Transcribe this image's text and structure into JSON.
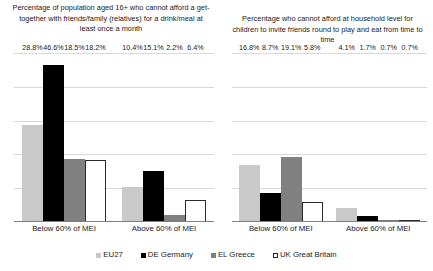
{
  "chart_data": [
    {
      "type": "bar",
      "id": "left",
      "title": "Percentage of population aged 16+ who cannot afford a get-together with friends/family (relatives) for a drink/meal at least once a month",
      "xlabel": "",
      "ylabel": "",
      "ylim": [
        0,
        50
      ],
      "grid": true,
      "gridlines": [
        10,
        20,
        30,
        40,
        50
      ],
      "legend_position": "bottom",
      "categories": [
        "Below 60% of MEI",
        "Above 60% of MEI"
      ],
      "series": [
        {
          "name": "EU27",
          "color": "#c9c9c9",
          "values": [
            28.8,
            10.4
          ],
          "labels": [
            "28.8%",
            "10.4%"
          ]
        },
        {
          "name": "DE Germany",
          "color": "#000000",
          "values": [
            46.6,
            15.1
          ],
          "labels": [
            "46.6%",
            "15.1%"
          ]
        },
        {
          "name": "EL Greece",
          "color": "#808080",
          "values": [
            18.5,
            2.2
          ],
          "labels": [
            "18.5%",
            "2.2%"
          ]
        },
        {
          "name": "UK Great Britain",
          "color": "#ffffff",
          "values": [
            18.2,
            6.4
          ],
          "labels": [
            "18.2%",
            "6.4%"
          ]
        }
      ]
    },
    {
      "type": "bar",
      "id": "right",
      "title": "Percentage who cannot afford at household level for children to invite friends round to play and eat from time to time",
      "xlabel": "",
      "ylabel": "",
      "ylim": [
        0,
        50
      ],
      "grid": true,
      "gridlines": [
        10,
        20,
        30,
        40,
        50
      ],
      "legend_position": "bottom",
      "categories": [
        "Below 60% of MEI",
        "Above 60% of MEI"
      ],
      "series": [
        {
          "name": "EU27",
          "color": "#c9c9c9",
          "values": [
            16.8,
            4.1
          ],
          "labels": [
            "16.8%",
            "4.1%"
          ]
        },
        {
          "name": "DE Germany",
          "color": "#000000",
          "values": [
            8.7,
            1.7
          ],
          "labels": [
            "8.7%",
            "1.7%"
          ]
        },
        {
          "name": "EL Greece",
          "color": "#808080",
          "values": [
            19.1,
            0.7
          ],
          "labels": [
            "19.1%",
            "0.7%"
          ]
        },
        {
          "name": "UK Great Britain",
          "color": "#ffffff",
          "values": [
            5.8,
            0.7
          ],
          "labels": [
            "5.8%",
            "0.7%"
          ]
        }
      ]
    }
  ],
  "legend": {
    "items": [
      {
        "label": "EU27",
        "swatch": "eu27"
      },
      {
        "label": "DE Germany",
        "swatch": "de"
      },
      {
        "label": "EL Greece",
        "swatch": "el"
      },
      {
        "label": "UK Great Britain",
        "swatch": "uk"
      }
    ]
  }
}
